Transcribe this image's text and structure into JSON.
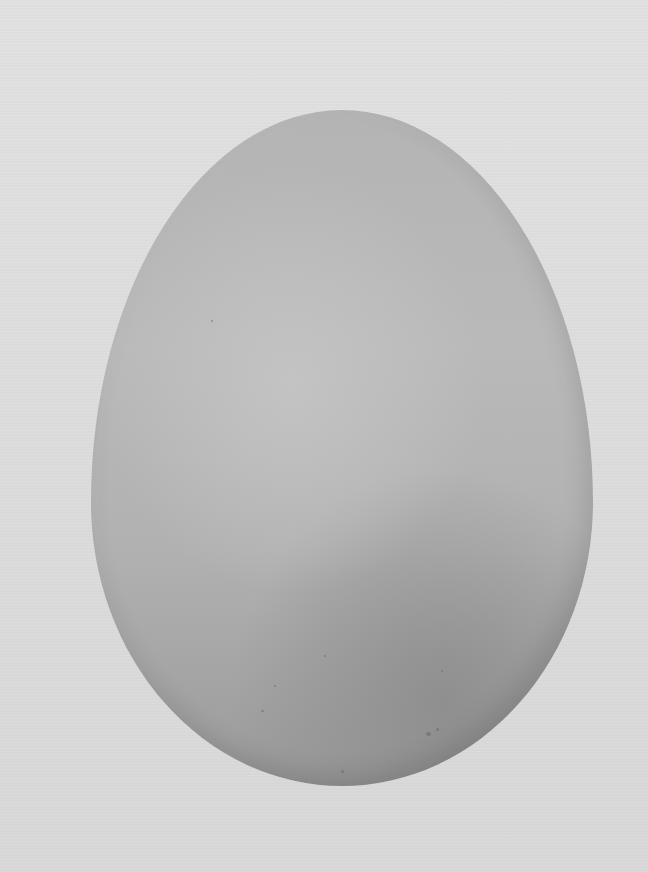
{
  "image": {
    "subject": "egg",
    "description": "Grayscale photograph of a single egg on a light gray background",
    "colors": {
      "background": "#dedede",
      "egg_light": "#c3c3c3",
      "egg_mid": "#b4b4b4",
      "egg_shadow": "#8f8f8f",
      "speckles": "#6a6a6a"
    }
  }
}
